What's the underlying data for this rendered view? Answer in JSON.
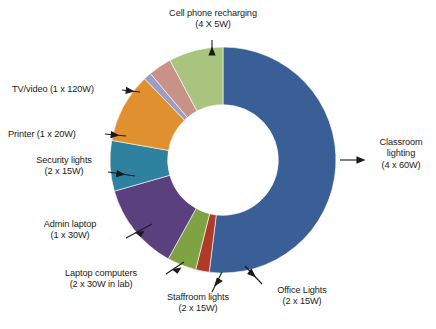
{
  "chart_data": {
    "type": "pie",
    "variant": "donut",
    "title": "",
    "subtitle": "",
    "xlabel": "",
    "ylabel": "",
    "legend_position": "callout-labels",
    "grid": false,
    "unit": "W",
    "total_watts": 580,
    "start_angle_deg": 0,
    "direction": "clockwise",
    "inner_radius_ratio": 0.49,
    "categories": [
      "Classroom lighting",
      "Office Lights",
      "Staffroom lights",
      "Laptop computers",
      "Admin laptop",
      "Security lights",
      "Printer",
      "TV/video",
      "Cell phone recharging"
    ],
    "values": [
      240,
      30,
      30,
      60,
      30,
      30,
      20,
      120,
      20
    ],
    "angles_deg": [
      187,
      7,
      15,
      45,
      26,
      36,
      4,
      52,
      28
    ],
    "colors": [
      "#3a5f96",
      "#b03a28",
      "#7fa342",
      "#5b4080",
      "#2e82a0",
      "#e0902f",
      "#9a9ec4",
      "#c89289",
      "#a9c47f"
    ],
    "slices": [
      {
        "name": "Classroom lighting",
        "label_line1": "Classroom",
        "label_line2": "lighting",
        "label_line3": "(4 x 60W)",
        "quantity": 4,
        "watts_each": 60,
        "watts_total": 240,
        "color": "#3a5f96",
        "start_deg": 0,
        "end_deg": 187
      },
      {
        "name": "Office Lights",
        "label_line1": "Office Lights",
        "label_line2": "(2 x 15W)",
        "quantity": 2,
        "watts_each": 15,
        "watts_total": 30,
        "color": "#b03a28",
        "start_deg": 187,
        "end_deg": 194
      },
      {
        "name": "Staffroom lights",
        "label_line1": "Staffroom lights",
        "label_line2": "(2 x 15W)",
        "quantity": 2,
        "watts_each": 15,
        "watts_total": 30,
        "color": "#7fa342",
        "start_deg": 194,
        "end_deg": 209
      },
      {
        "name": "Laptop computers",
        "label_line1": "Laptop computers",
        "label_line2": "(2 x 30W in lab)",
        "quantity": 2,
        "watts_each": 30,
        "watts_total": 60,
        "color": "#5b4080",
        "start_deg": 209,
        "end_deg": 254
      },
      {
        "name": "Admin laptop",
        "label_line1": "Admin laptop",
        "label_line2": "(1 x 30W)",
        "quantity": 1,
        "watts_each": 30,
        "watts_total": 30,
        "color": "#2e82a0",
        "start_deg": 254,
        "end_deg": 280
      },
      {
        "name": "Security lights",
        "label_line1": "Security lights",
        "label_line2": "(2 x 15W)",
        "quantity": 2,
        "watts_each": 15,
        "watts_total": 30,
        "color": "#e0902f",
        "start_deg": 280,
        "end_deg": 316
      },
      {
        "name": "Printer",
        "label_line1": "Printer (1 x 20W)",
        "label_line2": "",
        "quantity": 1,
        "watts_each": 20,
        "watts_total": 20,
        "color": "#9a9ec4",
        "start_deg": 316,
        "end_deg": 320
      },
      {
        "name": "TV/video",
        "label_line1": "TV/video (1 x 120W)",
        "label_line2": "",
        "quantity": 1,
        "watts_each": 120,
        "watts_total": 120,
        "color": "#c89289",
        "start_deg": 320,
        "end_deg": 332
      },
      {
        "name": "Cell phone recharging",
        "label_line1": "Cell phone recharging",
        "label_line2": "(4 X 5W)",
        "quantity": 4,
        "watts_each": 5,
        "watts_total": 20,
        "color": "#a9c47f",
        "start_deg": 332,
        "end_deg": 360
      }
    ]
  },
  "labels": {
    "cell_phone": {
      "line1": "Cell phone recharging",
      "line2": "(4 X 5W)"
    },
    "tv_video": {
      "line1": "TV/video (1 x 120W)",
      "line2": ""
    },
    "printer": {
      "line1": "Printer (1 x 20W)",
      "line2": ""
    },
    "security_lights": {
      "line1": "Security lights",
      "line2": "(2 x 15W)"
    },
    "admin_laptop": {
      "line1": "Admin laptop",
      "line2": "(1 x 30W)"
    },
    "laptop_computers": {
      "line1": "Laptop computers",
      "line2": "(2 x 30W in lab)"
    },
    "staffroom_lights": {
      "line1": "Staffroom lights",
      "line2": "(2 x 15W)"
    },
    "office_lights": {
      "line1": "Office Lights",
      "line2": "(2 x 15W)"
    },
    "classroom_lighting": {
      "line1": "Classroom",
      "line2": "lighting",
      "line3": "(4 x 60W)"
    }
  }
}
